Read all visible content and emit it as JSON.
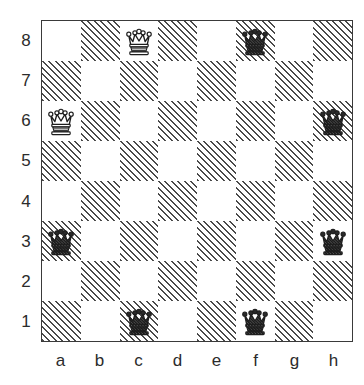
{
  "diagram": {
    "kind": "chessboard-diagram",
    "board_size": 8,
    "orientation": "white-bottom",
    "light_square_color": "#ffffff",
    "dark_square_color": "#4a4a4a",
    "dark_square_style": "diagonal-hatch",
    "border_color": "#3a3a3a",
    "label_color": "#2b2b2b"
  },
  "coordinates": {
    "files": [
      "a",
      "b",
      "c",
      "d",
      "e",
      "f",
      "g",
      "h"
    ],
    "ranks": [
      "8",
      "7",
      "6",
      "5",
      "4",
      "3",
      "2",
      "1"
    ]
  },
  "pieces": [
    {
      "square": "c8",
      "type": "queen",
      "color": "white",
      "glyph": "white-queen",
      "square_shade": "dark"
    },
    {
      "square": "f8",
      "type": "queen",
      "color": "black",
      "glyph": "black-queen",
      "square_shade": "light"
    },
    {
      "square": "a6",
      "type": "queen",
      "color": "white",
      "glyph": "white-queen",
      "square_shade": "light"
    },
    {
      "square": "h6",
      "type": "queen",
      "color": "black",
      "glyph": "black-queen",
      "square_shade": "dark"
    },
    {
      "square": "a3",
      "type": "queen",
      "color": "black",
      "glyph": "black-queen",
      "square_shade": "dark"
    },
    {
      "square": "h3",
      "type": "queen",
      "color": "black",
      "glyph": "black-queen",
      "square_shade": "light"
    },
    {
      "square": "c1",
      "type": "queen",
      "color": "black",
      "glyph": "black-queen",
      "square_shade": "dark"
    },
    {
      "square": "f1",
      "type": "queen",
      "color": "black",
      "glyph": "black-queen",
      "square_shade": "light"
    }
  ],
  "chart_data": {
    "type": "heatmap",
    "xlabel": "file",
    "ylabel": "rank",
    "categories": [
      "a",
      "b",
      "c",
      "d",
      "e",
      "f",
      "g",
      "h"
    ],
    "rows": [
      "8",
      "7",
      "6",
      "5",
      "4",
      "3",
      "2",
      "1"
    ],
    "grid": true,
    "legend": "none",
    "values": [
      [
        "",
        "",
        "Qw",
        "",
        "",
        "Qb",
        "",
        ""
      ],
      [
        "",
        "",
        "",
        "",
        "",
        "",
        "",
        ""
      ],
      [
        "Qw",
        "",
        "",
        "",
        "",
        "",
        "",
        "Qb"
      ],
      [
        "",
        "",
        "",
        "",
        "",
        "",
        "",
        ""
      ],
      [
        "",
        "",
        "",
        "",
        "",
        "",
        "",
        ""
      ],
      [
        "Qb",
        "",
        "",
        "",
        "",
        "",
        "",
        "Qb"
      ],
      [
        "",
        "",
        "",
        "",
        "",
        "",
        "",
        ""
      ],
      [
        "",
        "",
        "Qb",
        "",
        "",
        "Qb",
        "",
        ""
      ]
    ],
    "occupied_squares": [
      "c8",
      "f8",
      "a6",
      "h6",
      "a3",
      "h3",
      "c1",
      "f1"
    ],
    "piece_count": 8
  }
}
